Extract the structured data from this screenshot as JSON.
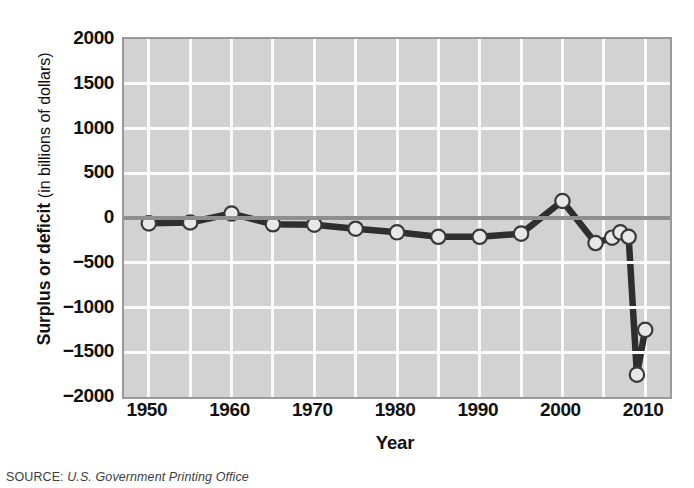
{
  "chart_data": {
    "type": "line",
    "title": "",
    "subtitle": "",
    "xlabel": "Year",
    "ylabel": "Surplus or deficit (in billions of dollars)",
    "ylabel_bold_part": "Surplus or deficit",
    "ylabel_light_part": "(in billions of dollars)",
    "xlim": [
      1947,
      2013
    ],
    "ylim": [
      -2000,
      2000
    ],
    "grid": true,
    "grid_x_step": 5,
    "grid_y_step": 500,
    "legend": "none",
    "series": [
      {
        "name": "Federal surplus or deficit",
        "x": [
          1950,
          1955,
          1960,
          1965,
          1970,
          1975,
          1980,
          1985,
          1990,
          1995,
          2000,
          2004,
          2006,
          2007,
          2008,
          2009,
          2010
        ],
        "values": [
          -60,
          -50,
          50,
          -70,
          -75,
          -120,
          -160,
          -210,
          -210,
          -175,
          190,
          -280,
          -220,
          -160,
          -210,
          -1750,
          -1250
        ]
      }
    ],
    "x_tick_labels": [
      "1950",
      "1960",
      "1970",
      "1980",
      "1990",
      "2000",
      "2010"
    ],
    "x_tick_values": [
      1950,
      1960,
      1970,
      1980,
      1990,
      2000,
      2010
    ],
    "y_tick_labels": [
      "2000",
      "1500",
      "1000",
      "500",
      "0",
      "−500",
      "−1000",
      "−1500",
      "−2000"
    ],
    "y_tick_values": [
      2000,
      1500,
      1000,
      500,
      0,
      -500,
      -1000,
      -1500,
      -2000
    ],
    "colors": {
      "plot_background": "#d2d2d2",
      "gridline": "#fbfbfb",
      "frame": "#9a9a9a",
      "line": "#2e2e2e",
      "marker_fill": "#e8e8e8",
      "marker_edge": "#3a3a3a",
      "zero_line": "#8e8e8e",
      "text": "#111111"
    }
  },
  "source": {
    "label": "SOURCE:",
    "value": "U.S. Government Printing Office"
  }
}
